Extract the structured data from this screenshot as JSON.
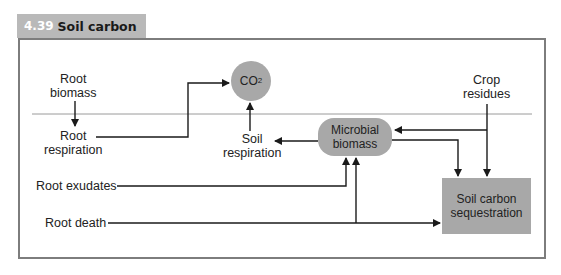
{
  "figure": {
    "number": "4.39",
    "title": "Soil carbon"
  },
  "nodes": {
    "root_biomass": "Root\nbiomass",
    "root_respiration": "Root\nrespiration",
    "co2_main": "CO",
    "co2_sub": "2",
    "soil_respiration": "Soil\nrespiration",
    "microbial_biomass": "Microbial\nbiomass",
    "crop_residues": "Crop\nresidues",
    "root_exudates": "Root exudates",
    "root_death": "Root death",
    "soil_carbon_sequestration": "Soil carbon\nsequestration"
  },
  "colors": {
    "header_bg": "#b9b9b9",
    "node_fill": "#a8a8a8",
    "frame_border": "#7d7d7d",
    "horizon_line": "#9a9a9a",
    "arrow": "#1a1a1a"
  }
}
